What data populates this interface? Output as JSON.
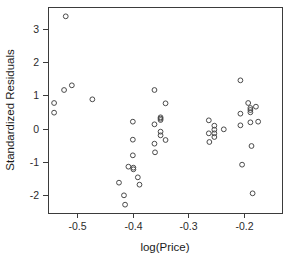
{
  "chart_data": {
    "type": "scatter",
    "title": "",
    "xlabel": "log(Price)",
    "ylabel": "Standardized Residuals",
    "xlim": [
      -0.553,
      -0.131
    ],
    "ylim": [
      -2.53,
      3.65
    ],
    "grid": false,
    "legend": null,
    "xticks": [
      -0.5,
      -0.4,
      -0.3,
      -0.2
    ],
    "xticklabels": [
      "-0.5",
      "-0.4",
      "-0.3",
      "-0.2"
    ],
    "yticks": [
      3,
      2,
      1,
      0,
      -1,
      -2
    ],
    "yticklabels": [
      "3",
      "2",
      "1",
      "0",
      "-1",
      "-2"
    ],
    "marker": "open-circle",
    "marker_color": "#4a4a4a",
    "points": [
      {
        "x": -0.521,
        "y": 3.37
      },
      {
        "x": -0.542,
        "y": 0.77
      },
      {
        "x": -0.542,
        "y": 0.48
      },
      {
        "x": -0.524,
        "y": 1.16
      },
      {
        "x": -0.51,
        "y": 1.3
      },
      {
        "x": -0.473,
        "y": 0.88
      },
      {
        "x": -0.425,
        "y": -1.62
      },
      {
        "x": -0.416,
        "y": -2.0
      },
      {
        "x": -0.414,
        "y": -2.28
      },
      {
        "x": -0.408,
        "y": -1.14
      },
      {
        "x": -0.4,
        "y": 0.21
      },
      {
        "x": -0.4,
        "y": -0.33
      },
      {
        "x": -0.4,
        "y": -0.8
      },
      {
        "x": -0.399,
        "y": -1.17
      },
      {
        "x": -0.399,
        "y": -1.22
      },
      {
        "x": -0.391,
        "y": -1.46
      },
      {
        "x": -0.388,
        "y": -1.68
      },
      {
        "x": -0.361,
        "y": 1.16
      },
      {
        "x": -0.361,
        "y": 0.13
      },
      {
        "x": -0.361,
        "y": -0.45
      },
      {
        "x": -0.36,
        "y": -0.71
      },
      {
        "x": -0.35,
        "y": 0.34
      },
      {
        "x": -0.35,
        "y": 0.3
      },
      {
        "x": -0.35,
        "y": 0.26
      },
      {
        "x": -0.35,
        "y": -0.09
      },
      {
        "x": -0.35,
        "y": -0.2
      },
      {
        "x": -0.341,
        "y": 0.76
      },
      {
        "x": -0.341,
        "y": -0.34
      },
      {
        "x": -0.263,
        "y": 0.25
      },
      {
        "x": -0.263,
        "y": -0.14
      },
      {
        "x": -0.262,
        "y": -0.4
      },
      {
        "x": -0.253,
        "y": 0.09
      },
      {
        "x": -0.253,
        "y": -0.03
      },
      {
        "x": -0.253,
        "y": -0.14
      },
      {
        "x": -0.253,
        "y": -0.25
      },
      {
        "x": -0.236,
        "y": -0.02
      },
      {
        "x": -0.206,
        "y": 1.45
      },
      {
        "x": -0.206,
        "y": 0.45
      },
      {
        "x": -0.206,
        "y": 0.1
      },
      {
        "x": -0.203,
        "y": -1.08
      },
      {
        "x": -0.192,
        "y": 0.77
      },
      {
        "x": -0.188,
        "y": 0.62
      },
      {
        "x": -0.188,
        "y": 0.56
      },
      {
        "x": -0.188,
        "y": 0.49
      },
      {
        "x": -0.188,
        "y": 0.19
      },
      {
        "x": -0.186,
        "y": -0.52
      },
      {
        "x": -0.184,
        "y": -1.94
      },
      {
        "x": -0.178,
        "y": 0.66
      },
      {
        "x": -0.174,
        "y": 0.21
      }
    ]
  },
  "axes": {
    "x_label": "log(Price)",
    "y_label": "Standardized Residuals"
  }
}
